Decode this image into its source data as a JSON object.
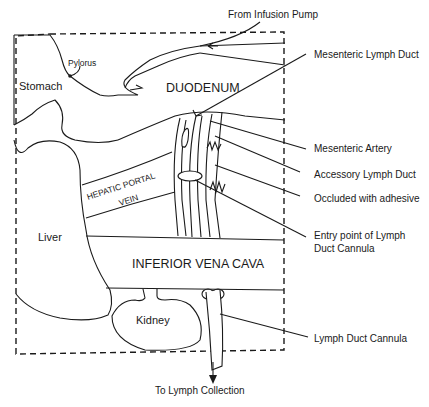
{
  "diagram": {
    "type": "anatomical-schematic",
    "organs": {
      "stomach": "Stomach",
      "pylorus": "Pylorus",
      "duodenum": "DUODENUM",
      "hepatic_portal_vein_line1": "HEPATIC PORTAL",
      "hepatic_portal_vein_line2": "VEIN",
      "liver": "Liver",
      "inferior_vena_cava": "INFERIOR VENA CAVA",
      "kidney": "Kidney"
    },
    "callouts": {
      "infusion_pump": "From Infusion Pump",
      "mesenteric_lymph_duct": "Mesenteric Lymph Duct",
      "mesenteric_artery": "Mesenteric Artery",
      "accessory_lymph_duct": "Accessory Lymph Duct",
      "occluded": "Occluded with adhesive",
      "entry_point_line1": "Entry point of Lymph",
      "entry_point_line2": "Duct Cannula",
      "lymph_duct_cannula": "Lymph Duct Cannula",
      "lymph_collection": "To Lymph Collection"
    },
    "colors": {
      "stroke": "#1a1a1a",
      "background": "#ffffff"
    }
  }
}
